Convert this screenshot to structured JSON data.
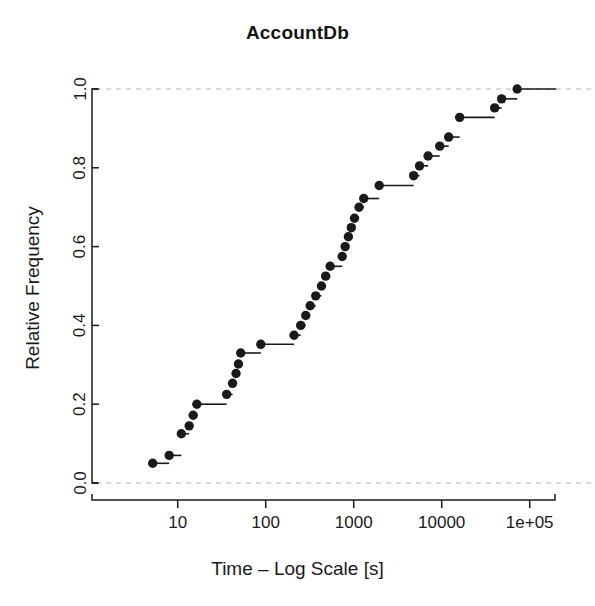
{
  "chart_data": {
    "type": "line",
    "subtype": "empirical-cdf-step",
    "title": "AccountDb",
    "xlabel": "Time – Log Scale [s]",
    "ylabel": "Relative Frequency",
    "xscale": "log10",
    "xlim": [
      3.2,
      200000
    ],
    "ylim": [
      0.0,
      1.0
    ],
    "grid": false,
    "legend": null,
    "x_tick_values": [
      10,
      100,
      1000,
      10000,
      100000
    ],
    "x_tick_labels": [
      "10",
      "100",
      "1000",
      "10000",
      "1e+05"
    ],
    "y_ticks": [
      0.0,
      0.2,
      0.4,
      0.6,
      0.8,
      1.0
    ],
    "y_tick_labels": [
      "0.0",
      "0.2",
      "0.4",
      "0.6",
      "0.8",
      "1.0"
    ],
    "reference_lines": [
      {
        "y": 0.0,
        "style": "dashed",
        "color": "#b4b4b4"
      },
      {
        "y": 1.0,
        "style": "dashed",
        "color": "#b4b4b4"
      }
    ],
    "marker": {
      "shape": "circle",
      "color": "#1a1a1a",
      "size": 7
    },
    "line": {
      "color": "#1a1a1a",
      "width": 1.6,
      "style": "solid"
    },
    "series": [
      {
        "name": "AccountDb",
        "points": [
          {
            "x": 5.2,
            "y": 0.05
          },
          {
            "x": 8.0,
            "y": 0.07
          },
          {
            "x": 11.0,
            "y": 0.125
          },
          {
            "x": 13.5,
            "y": 0.145
          },
          {
            "x": 15.0,
            "y": 0.172
          },
          {
            "x": 16.5,
            "y": 0.2
          },
          {
            "x": 36.0,
            "y": 0.225
          },
          {
            "x": 42.0,
            "y": 0.253
          },
          {
            "x": 46.0,
            "y": 0.278
          },
          {
            "x": 49.0,
            "y": 0.302
          },
          {
            "x": 52.0,
            "y": 0.33
          },
          {
            "x": 88.0,
            "y": 0.352
          },
          {
            "x": 210.0,
            "y": 0.375
          },
          {
            "x": 250.0,
            "y": 0.4
          },
          {
            "x": 285.0,
            "y": 0.425
          },
          {
            "x": 320.0,
            "y": 0.45
          },
          {
            "x": 370.0,
            "y": 0.475
          },
          {
            "x": 430.0,
            "y": 0.5
          },
          {
            "x": 480.0,
            "y": 0.525
          },
          {
            "x": 540.0,
            "y": 0.55
          },
          {
            "x": 740.0,
            "y": 0.575
          },
          {
            "x": 800.0,
            "y": 0.6
          },
          {
            "x": 870.0,
            "y": 0.625
          },
          {
            "x": 940.0,
            "y": 0.648
          },
          {
            "x": 1020.0,
            "y": 0.672
          },
          {
            "x": 1150.0,
            "y": 0.7
          },
          {
            "x": 1300.0,
            "y": 0.722
          },
          {
            "x": 1950.0,
            "y": 0.755
          },
          {
            "x": 4800.0,
            "y": 0.78
          },
          {
            "x": 5600.0,
            "y": 0.805
          },
          {
            "x": 7000.0,
            "y": 0.83
          },
          {
            "x": 9500.0,
            "y": 0.855
          },
          {
            "x": 12000.0,
            "y": 0.878
          },
          {
            "x": 16000.0,
            "y": 0.928
          },
          {
            "x": 40000.0,
            "y": 0.952
          },
          {
            "x": 48000.0,
            "y": 0.975
          },
          {
            "x": 72000.0,
            "y": 1.0
          }
        ]
      }
    ]
  },
  "figure": {
    "title": "AccountDb",
    "xlabel": "Time – Log Scale [s]",
    "ylabel": "Relative Frequency"
  }
}
